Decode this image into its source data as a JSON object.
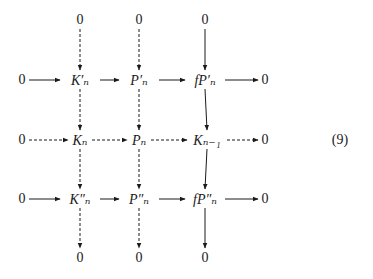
{
  "diagram": {
    "equation_label": "(9)",
    "nodes": [
      {
        "id": "t1",
        "label": "0",
        "x": 80,
        "y": 20
      },
      {
        "id": "t2",
        "label": "0",
        "x": 139,
        "y": 20
      },
      {
        "id": "t3",
        "label": "0",
        "x": 205,
        "y": 20
      },
      {
        "id": "r1c0",
        "label": "0",
        "x": 22,
        "y": 80
      },
      {
        "id": "r1c1",
        "label": "K′ₙ",
        "x": 80,
        "y": 80
      },
      {
        "id": "r1c2",
        "label": "P′ₙ",
        "x": 139,
        "y": 80
      },
      {
        "id": "r1c3",
        "label": "fP′ₙ",
        "x": 205,
        "y": 80
      },
      {
        "id": "r1c4",
        "label": "0",
        "x": 265,
        "y": 80
      },
      {
        "id": "r2c0",
        "label": "0",
        "x": 22,
        "y": 140
      },
      {
        "id": "r2c1",
        "label": "Kₙ",
        "x": 80,
        "y": 140
      },
      {
        "id": "r2c2",
        "label": "Pₙ",
        "x": 139,
        "y": 140
      },
      {
        "id": "r2c3",
        "label": "Kₙ₋₁",
        "x": 207,
        "y": 140
      },
      {
        "id": "r2c4",
        "label": "0",
        "x": 265,
        "y": 140
      },
      {
        "id": "r3c0",
        "label": "0",
        "x": 22,
        "y": 199
      },
      {
        "id": "r3c1",
        "label": "K″ₙ",
        "x": 80,
        "y": 199
      },
      {
        "id": "r3c2",
        "label": "P″ₙ",
        "x": 139,
        "y": 199
      },
      {
        "id": "r3c3",
        "label": "fP″ₙ",
        "x": 205,
        "y": 199
      },
      {
        "id": "r3c4",
        "label": "0",
        "x": 265,
        "y": 199
      },
      {
        "id": "b1",
        "label": "0",
        "x": 80,
        "y": 258
      },
      {
        "id": "b2",
        "label": "0",
        "x": 139,
        "y": 258
      },
      {
        "id": "b3",
        "label": "0",
        "x": 205,
        "y": 258
      }
    ],
    "edges": [
      {
        "from": "t1",
        "to": "r1c1",
        "style": "dashed"
      },
      {
        "from": "t2",
        "to": "r1c2",
        "style": "dashed"
      },
      {
        "from": "t3",
        "to": "r1c3",
        "style": "solid"
      },
      {
        "from": "r1c0",
        "to": "r1c1",
        "style": "solid"
      },
      {
        "from": "r1c1",
        "to": "r1c2",
        "style": "solid"
      },
      {
        "from": "r1c2",
        "to": "r1c3",
        "style": "solid"
      },
      {
        "from": "r1c3",
        "to": "r1c4",
        "style": "solid"
      },
      {
        "from": "r1c1",
        "to": "r2c1",
        "style": "dashed"
      },
      {
        "from": "r1c2",
        "to": "r2c2",
        "style": "dashed"
      },
      {
        "from": "r1c3",
        "to": "r2c3",
        "style": "solid"
      },
      {
        "from": "r2c0",
        "to": "r2c1",
        "style": "dashed"
      },
      {
        "from": "r2c1",
        "to": "r2c2",
        "style": "dashed"
      },
      {
        "from": "r2c2",
        "to": "r2c3",
        "style": "dashed"
      },
      {
        "from": "r2c3",
        "to": "r2c4",
        "style": "dashed"
      },
      {
        "from": "r2c1",
        "to": "r3c1",
        "style": "dashed"
      },
      {
        "from": "r2c2",
        "to": "r3c2",
        "style": "dashed"
      },
      {
        "from": "r2c3",
        "to": "r3c3",
        "style": "solid"
      },
      {
        "from": "r3c0",
        "to": "r3c1",
        "style": "solid"
      },
      {
        "from": "r3c1",
        "to": "r3c2",
        "style": "solid"
      },
      {
        "from": "r3c2",
        "to": "r3c3",
        "style": "solid"
      },
      {
        "from": "r3c3",
        "to": "r3c4",
        "style": "solid"
      },
      {
        "from": "r3c1",
        "to": "b1",
        "style": "dashed"
      },
      {
        "from": "r3c2",
        "to": "b2",
        "style": "dashed"
      },
      {
        "from": "r3c3",
        "to": "b3",
        "style": "solid"
      }
    ]
  }
}
